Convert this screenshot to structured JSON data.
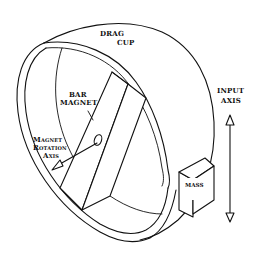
{
  "diagram": {
    "labels": {
      "drag_cup_line1": "DRAG",
      "drag_cup_line2": "CUP",
      "bar_magnet_line1": "BAR",
      "bar_magnet_line2": "MAGNET",
      "input_axis_line1": "INPUT",
      "input_axis_line2": "AXIS",
      "rotation_axis_line1": "Magnet",
      "rotation_axis_line2": "Rotation",
      "rotation_axis_line3": "Axis",
      "mass": "MASS"
    },
    "colors": {
      "ink": "#111111",
      "background": "#ffffff"
    }
  }
}
